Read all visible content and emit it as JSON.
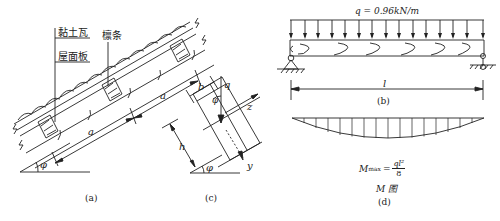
{
  "figure": {
    "panel_a": {
      "caption": "(a)",
      "labels": {
        "tile": "黏土瓦",
        "roof_board": "屋面板",
        "purlin": "檩条",
        "spacing_1": "a",
        "spacing_2": "a",
        "angle": "φ"
      }
    },
    "panel_c": {
      "caption": "(c)",
      "labels": {
        "width": "b",
        "height": "h",
        "load": "q",
        "angle_top": "φ",
        "angle_bottom": "φ",
        "axis_z": "z",
        "axis_y": "y"
      }
    },
    "panel_b": {
      "caption": "(b)",
      "load_label": "q = 0.96kN/m",
      "span_label": "l"
    },
    "panel_d": {
      "caption": "(d)",
      "diagram_title": "M 图",
      "mmax_lhs": "M",
      "mmax_sub": "max",
      "mmax_eq": "=",
      "mmax_num": "ql²",
      "mmax_den": "8"
    }
  },
  "colors": {
    "line": "#222222",
    "background": "#ffffff"
  }
}
